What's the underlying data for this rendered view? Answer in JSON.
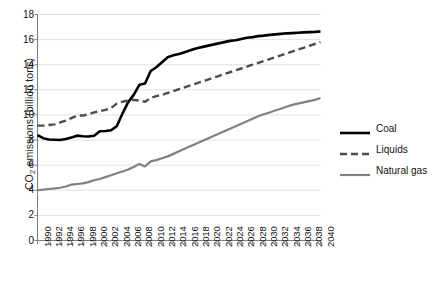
{
  "chart_data": {
    "type": "line",
    "title": "",
    "xlabel": "",
    "ylabel": "CO2 emissions (billion tons)",
    "ylabel_base": "CO",
    "ylabel_sub": "2",
    "ylabel_rest": " emissions (billion tons)",
    "xlim": [
      1990,
      2040
    ],
    "ylim": [
      0,
      18
    ],
    "ytick_step": 2,
    "xtick_step": 2,
    "grid": "horizontal",
    "legend_position": "right",
    "yticks": [
      0,
      2,
      4,
      6,
      8,
      10,
      12,
      14,
      16,
      18
    ],
    "xticks": [
      1990,
      1992,
      1994,
      1996,
      1998,
      2000,
      2002,
      2004,
      2006,
      2008,
      2010,
      2012,
      2014,
      2016,
      2018,
      2020,
      2022,
      2024,
      2026,
      2028,
      2030,
      2032,
      2034,
      2036,
      2038,
      2040
    ],
    "x": [
      1990,
      1991,
      1992,
      1993,
      1994,
      1995,
      1996,
      1997,
      1998,
      1999,
      2000,
      2001,
      2002,
      2003,
      2004,
      2005,
      2006,
      2007,
      2008,
      2009,
      2010,
      2011,
      2012,
      2013,
      2014,
      2015,
      2016,
      2017,
      2018,
      2019,
      2020,
      2021,
      2022,
      2023,
      2024,
      2025,
      2026,
      2027,
      2028,
      2029,
      2030,
      2031,
      2032,
      2033,
      2034,
      2035,
      2036,
      2037,
      2038,
      2039,
      2040
    ],
    "series": [
      {
        "name": "Coal",
        "color": "#000000",
        "style": "solid",
        "width": 2.6,
        "values": [
          8.4,
          8.15,
          8.05,
          8.02,
          8.0,
          8.08,
          8.2,
          8.35,
          8.3,
          8.28,
          8.35,
          8.7,
          8.72,
          8.78,
          9.1,
          10.1,
          11.0,
          11.6,
          12.4,
          12.5,
          13.5,
          13.8,
          14.2,
          14.6,
          14.75,
          14.85,
          15.0,
          15.15,
          15.3,
          15.4,
          15.5,
          15.6,
          15.7,
          15.8,
          15.9,
          15.95,
          16.05,
          16.15,
          16.2,
          16.28,
          16.32,
          16.38,
          16.42,
          16.46,
          16.5,
          16.52,
          16.55,
          16.58,
          16.6,
          16.62,
          16.65
        ]
      },
      {
        "name": "Liquids",
        "color": "#4d4d4d",
        "style": "dashed",
        "width": 2.4,
        "values": [
          9.15,
          9.15,
          9.2,
          9.25,
          9.4,
          9.55,
          9.75,
          9.95,
          9.95,
          10.05,
          10.2,
          10.3,
          10.4,
          10.55,
          10.9,
          11.05,
          11.15,
          11.2,
          11.15,
          11.05,
          11.35,
          11.5,
          11.6,
          11.75,
          11.9,
          12.05,
          12.2,
          12.35,
          12.5,
          12.65,
          12.8,
          12.95,
          13.1,
          13.25,
          13.4,
          13.55,
          13.7,
          13.85,
          14.0,
          14.15,
          14.3,
          14.45,
          14.6,
          14.75,
          14.9,
          15.05,
          15.2,
          15.35,
          15.5,
          15.65,
          15.8
        ]
      },
      {
        "name": "Natural gas",
        "color": "#808080",
        "style": "solid",
        "width": 2.2,
        "values": [
          4.0,
          4.05,
          4.1,
          4.15,
          4.2,
          4.3,
          4.45,
          4.5,
          4.55,
          4.65,
          4.8,
          4.9,
          5.05,
          5.2,
          5.35,
          5.5,
          5.65,
          5.85,
          6.1,
          5.9,
          6.3,
          6.4,
          6.55,
          6.7,
          6.9,
          7.1,
          7.3,
          7.5,
          7.7,
          7.9,
          8.1,
          8.3,
          8.5,
          8.7,
          8.9,
          9.1,
          9.3,
          9.5,
          9.7,
          9.9,
          10.05,
          10.2,
          10.35,
          10.5,
          10.65,
          10.8,
          10.9,
          11.0,
          11.1,
          11.2,
          11.35
        ]
      }
    ]
  }
}
